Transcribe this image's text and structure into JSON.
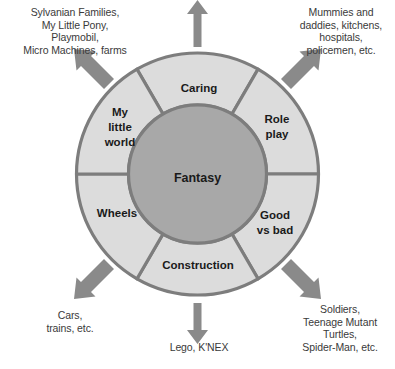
{
  "diagram": {
    "hub": {
      "label": "Fantasy"
    },
    "colors": {
      "segment_fill": "#dcdcdc",
      "hub_fill": "#a8a8a8",
      "stroke": "#7d7d7d",
      "arrow": "#8a8a8a",
      "text": "#1a1a1a",
      "callout_text": "#3a3a3a",
      "background": "#ffffff"
    },
    "segments": [
      {
        "id": "caring",
        "label": "Caring",
        "lines": [
          "Caring"
        ]
      },
      {
        "id": "role-play",
        "label": "Role play",
        "lines": [
          "Role",
          "play"
        ]
      },
      {
        "id": "good-vs-bad",
        "label": "Good vs bad",
        "lines": [
          "Good",
          "vs bad"
        ]
      },
      {
        "id": "construction",
        "label": "Construction",
        "lines": [
          "Construction"
        ]
      },
      {
        "id": "wheels",
        "label": "Wheels",
        "lines": [
          "Wheels"
        ]
      },
      {
        "id": "my-little-world",
        "label": "My little world",
        "lines": [
          "My",
          "little",
          "world"
        ]
      }
    ],
    "callouts": [
      {
        "id": "caring-examples",
        "position": "top",
        "text": "",
        "lines": []
      },
      {
        "id": "my-little-world-examples",
        "position": "top-left",
        "text": "Sylvanian Families,\nMy Little Pony,\nPlaymobil,\nMicro Machines, farms"
      },
      {
        "id": "role-play-examples",
        "position": "top-right",
        "text": "Mummies and\ndaddies, kitchens,\nhospitals,\npolicemen, etc."
      },
      {
        "id": "good-vs-bad-examples",
        "position": "bottom-right",
        "text": "Soldiers,\nTeenage Mutant\nTurtles,\nSpider-Man, etc."
      },
      {
        "id": "construction-examples",
        "position": "bottom",
        "text": "Lego, K'NEX"
      },
      {
        "id": "wheels-examples",
        "position": "bottom-left",
        "text": "Cars,\ntrains, etc."
      }
    ],
    "arrows": [
      {
        "id": "arrow-up",
        "direction": "up",
        "from_segment": "caring"
      },
      {
        "id": "arrow-up-left",
        "direction": "up-left",
        "from_segment": "my-little-world"
      },
      {
        "id": "arrow-up-right",
        "direction": "up-right",
        "from_segment": "role-play"
      },
      {
        "id": "arrow-down-right",
        "direction": "down-right",
        "from_segment": "good-vs-bad"
      },
      {
        "id": "arrow-down",
        "direction": "down",
        "from_segment": "construction"
      },
      {
        "id": "arrow-down-left",
        "direction": "down-left",
        "from_segment": "wheels"
      }
    ]
  }
}
